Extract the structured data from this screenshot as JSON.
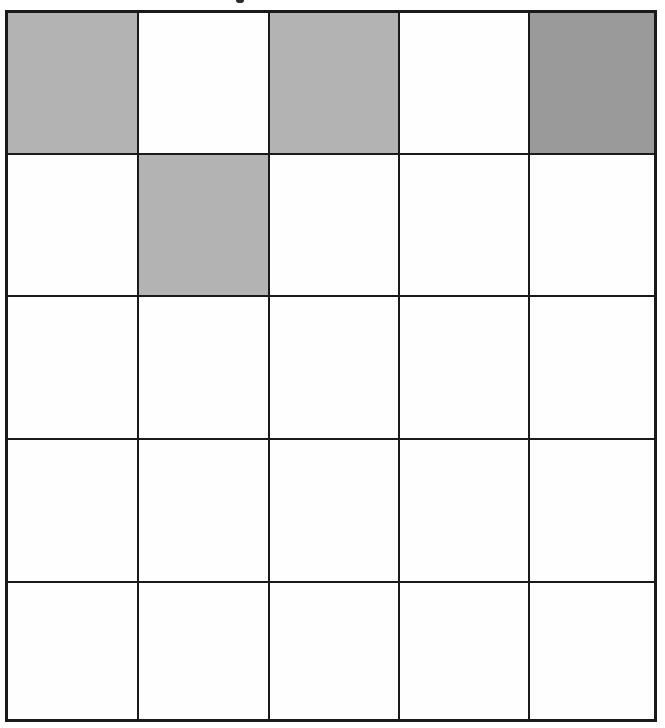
{
  "figure": {
    "type": "shaded-grid",
    "rows": 5,
    "columns": 5,
    "colors": {
      "border": "#1a1a1a",
      "empty": "#fefefe",
      "light": "#b3b3b3",
      "dark": "#9a9a9a"
    },
    "cells": [
      [
        "light",
        "empty",
        "light",
        "empty",
        "dark"
      ],
      [
        "empty",
        "light",
        "empty",
        "empty",
        "empty"
      ],
      [
        "empty",
        "empty",
        "empty",
        "empty",
        "empty"
      ],
      [
        "empty",
        "empty",
        "empty",
        "empty",
        "empty"
      ],
      [
        "empty",
        "empty",
        "empty",
        "empty",
        "empty"
      ]
    ]
  }
}
